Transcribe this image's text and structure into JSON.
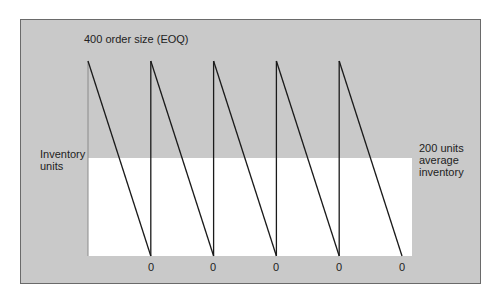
{
  "title": "400 order size (EOQ)",
  "y_axis_label": "Inventory\nunits",
  "average_label": "200 units\naverage\ninventory",
  "zero_labels": [
    "0",
    "0",
    "0",
    "0",
    "0"
  ],
  "colors": {
    "panel_background": "#c9c9c9",
    "average_region": "#ffffff",
    "line": "#1a1a1a",
    "text": "#222222"
  },
  "chart_data": {
    "type": "line",
    "title": "400 order size (EOQ)",
    "xlabel": "",
    "ylabel": "Inventory units",
    "annotations": [
      "400 order size (EOQ)",
      "200 units average inventory"
    ],
    "order_quantity": 400,
    "average_inventory": 200,
    "cycles": 5,
    "series": [
      {
        "name": "Inventory level (sawtooth)",
        "x": [
          0,
          0,
          1,
          1,
          2,
          2,
          3,
          3,
          4,
          4,
          5
        ],
        "values": [
          0,
          400,
          0,
          400,
          0,
          400,
          0,
          400,
          0,
          400,
          0
        ]
      }
    ],
    "x_tick_labels": [
      "0",
      "0",
      "0",
      "0",
      "0"
    ],
    "ylim": [
      0,
      400
    ],
    "grid": false,
    "legend": "none"
  }
}
